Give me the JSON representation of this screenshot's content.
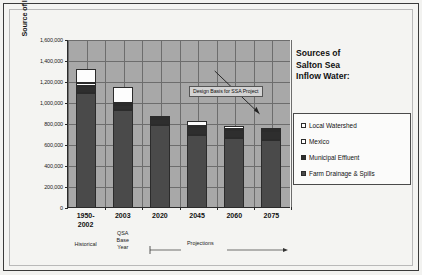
{
  "title": {
    "line1": "Sources of",
    "line2": "Salton Sea",
    "line3": "Inflow Water:"
  },
  "annotation": {
    "label": "Design Basis for SSA Project"
  },
  "axis": {
    "y_title": "Source of Inflow (AFY)"
  },
  "x_sublabels": {
    "historical": "Historical",
    "qsa_l1": "QSA",
    "qsa_l2": "Base",
    "qsa_l3": "Year",
    "projections": "Projections"
  },
  "legend": {
    "items": [
      {
        "label": "Local Watershed",
        "swatch": "open"
      },
      {
        "label": "Mexico",
        "swatch": "open"
      },
      {
        "label": "Municipal Effluent",
        "swatch": "fill1"
      },
      {
        "label": "Farm Drainage & Spills",
        "swatch": "fill2"
      }
    ]
  },
  "chart_data": {
    "type": "bar",
    "subtype": "stacked",
    "title": "Sources of Salton Sea Inflow Water:",
    "xlabel": "",
    "ylabel": "Source of Inflow (AFY)",
    "ylim": [
      0,
      1600000
    ],
    "ytick_labels": [
      "1,600,000",
      "1,400,000",
      "1,200,000",
      "1,000,000",
      "800,000",
      "600,000",
      "400,000",
      "200,000",
      "0"
    ],
    "ytick_values": [
      1600000,
      1400000,
      1200000,
      1000000,
      800000,
      600000,
      400000,
      200000,
      0
    ],
    "grid": true,
    "legend_position": "right",
    "categories": [
      "1950-2002",
      "2003",
      "2020",
      "2045",
      "2060",
      "2075"
    ],
    "series": [
      {
        "name": "Farm Drainage & Spills",
        "values": [
          1100000,
          930000,
          790000,
          700000,
          670000,
          650000
        ]
      },
      {
        "name": "Municipal Effluent",
        "values": [
          60000,
          50000,
          60000,
          70000,
          75000,
          80000
        ]
      },
      {
        "name": "Mexico",
        "values": [
          30000,
          20000,
          10000,
          10000,
          10000,
          10000
        ]
      },
      {
        "name": "Local Watershed",
        "values": [
          130000,
          150000,
          20000,
          50000,
          30000,
          25000
        ]
      }
    ],
    "totals": [
      1320000,
      1150000,
      880000,
      830000,
      785000,
      765000
    ],
    "annotations": [
      {
        "text": "Design Basis for SSA Project",
        "points_to": "2060"
      }
    ]
  }
}
